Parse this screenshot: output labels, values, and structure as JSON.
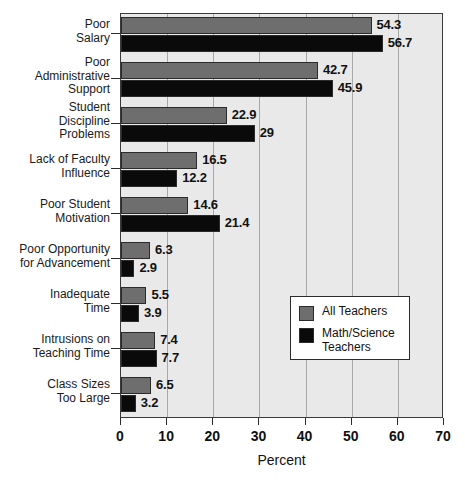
{
  "chart_data": {
    "type": "bar",
    "orientation": "horizontal",
    "title": "",
    "xlabel": "Percent",
    "ylabel": "",
    "xlim": [
      0,
      70
    ],
    "xticks": [
      0,
      10,
      20,
      30,
      40,
      50,
      60,
      70
    ],
    "xtick_labels": [
      "0",
      "10",
      "20",
      "30",
      "40",
      "50",
      "60",
      "70"
    ],
    "grid": true,
    "grid_axis": "x",
    "legend_position": "center-right",
    "categories": [
      "Poor\nSalary",
      "Poor\nAdministrative\nSupport",
      "Student\nDiscipline\nProblems",
      "Lack of Faculty\nInfluence",
      "Poor Student\nMotivation",
      "Poor Opportunity\nfor Advancement",
      "Inadequate\nTime",
      "Intrusions on\nTeaching Time",
      "Class Sizes\nToo Large"
    ],
    "series": [
      {
        "name": "All Teachers",
        "color": "#6e6e6e",
        "values": [
          54.3,
          42.7,
          22.9,
          16.5,
          14.6,
          6.3,
          5.5,
          7.4,
          6.5
        ],
        "value_labels": [
          "54.3",
          "42.7",
          "22.9",
          "16.5",
          "14.6",
          "6.3",
          "5.5",
          "7.4",
          "6.5"
        ]
      },
      {
        "name": "Math/Science Teachers",
        "color": "#0a0a0a",
        "values": [
          56.7,
          45.9,
          29,
          12.2,
          21.4,
          2.9,
          3.9,
          7.7,
          3.2
        ],
        "value_labels": [
          "56.7",
          "45.9",
          "29",
          "12.2",
          "21.4",
          "2.9",
          "3.9",
          "7.7",
          "3.2"
        ]
      }
    ]
  },
  "legend": {
    "entries": [
      {
        "label": "All Teachers",
        "color": "#6e6e6e"
      },
      {
        "label": "Math/Science\nTeachers",
        "color": "#0a0a0a"
      }
    ]
  },
  "colors": {
    "plot_background": "#e9e9e9",
    "gridline": "#a8a8a8",
    "axis": "#2b2b2b",
    "series_all_teachers": "#6e6e6e",
    "series_math_science": "#0a0a0a",
    "page_background": "#ffffff"
  }
}
